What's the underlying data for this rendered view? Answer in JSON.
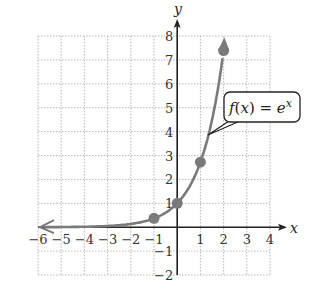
{
  "chart_data": {
    "type": "line",
    "title": "",
    "function_label": "f(x) = e^x",
    "function_label_parts": {
      "f": "f",
      "open": "(",
      "x": "x",
      "close": ")",
      "eq": " = ",
      "base": "e",
      "exp": "x"
    },
    "xlabel": "x",
    "ylabel": "y",
    "xlim": [
      -6,
      4
    ],
    "ylim": [
      -2,
      8
    ],
    "grid": true,
    "x_ticks": [
      -6,
      -5,
      -4,
      -3,
      -2,
      -1,
      1,
      2,
      3,
      4
    ],
    "x_tick_labels": [
      "−6",
      "−5",
      "−4",
      "−3",
      "−2",
      "−1",
      "1",
      "2",
      "3",
      "4"
    ],
    "y_ticks": [
      -2,
      -1,
      1,
      2,
      3,
      4,
      5,
      6,
      7,
      8
    ],
    "y_tick_labels": [
      "−2",
      "−1",
      "1",
      "2",
      "3",
      "4",
      "5",
      "6",
      "7",
      "8"
    ],
    "series": [
      {
        "name": "f(x) = e^x",
        "x": [
          -6,
          -5,
          -4,
          -3,
          -2,
          -1,
          0,
          1,
          2
        ],
        "y": [
          0.0025,
          0.0067,
          0.018,
          0.05,
          0.135,
          0.37,
          1,
          2.72,
          7.39
        ]
      }
    ],
    "marked_points": [
      {
        "x": -1,
        "y": 0.37
      },
      {
        "x": 0,
        "y": 1
      },
      {
        "x": 1,
        "y": 2.72
      },
      {
        "x": 2,
        "y": 7.39
      }
    ],
    "colors": {
      "curve": "#7a7a7a",
      "axes": "#222222",
      "grid": "#b8b8b8"
    }
  }
}
